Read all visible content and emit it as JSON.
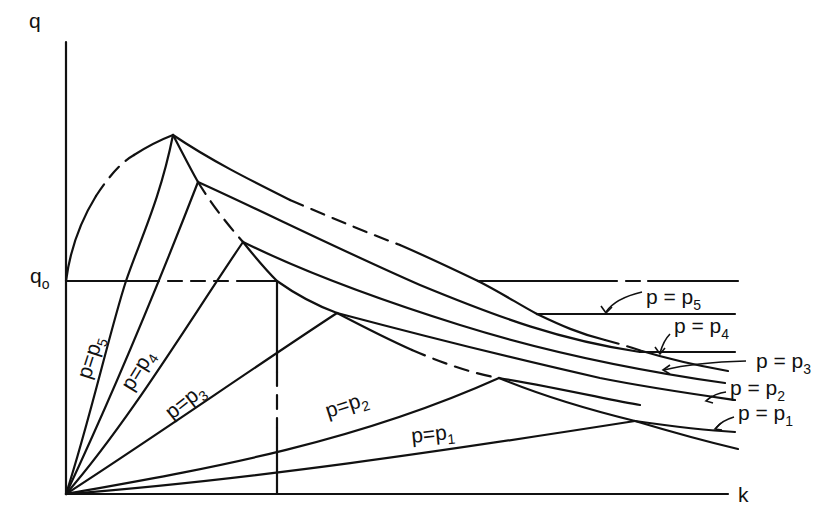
{
  "figure": {
    "type": "diagram",
    "axes": {
      "y_label": "q",
      "x_label": "k",
      "q0_label_main": "q",
      "q0_label_sub": "o"
    },
    "curves": [
      {
        "id": "p5",
        "label_main": "p=p",
        "label_sub": "5"
      },
      {
        "id": "p4",
        "label_main": "p=p",
        "label_sub": "4"
      },
      {
        "id": "p3",
        "label_main": "p=p",
        "label_sub": "3"
      },
      {
        "id": "p2",
        "label_main": "p=p",
        "label_sub": "2"
      },
      {
        "id": "p1",
        "label_main": "p=p",
        "label_sub": "1"
      }
    ],
    "right_labels": [
      {
        "id": "p5",
        "label_main": "p = p",
        "label_sub": "5"
      },
      {
        "id": "p4",
        "label_main": "p = p",
        "label_sub": "4"
      },
      {
        "id": "p3",
        "label_main": "p = p",
        "label_sub": "3"
      },
      {
        "id": "p2",
        "label_main": "p = p",
        "label_sub": "2"
      },
      {
        "id": "p1",
        "label_main": "p = p",
        "label_sub": "1"
      }
    ],
    "colors": {
      "ink": "#111111",
      "background": "#ffffff"
    }
  }
}
